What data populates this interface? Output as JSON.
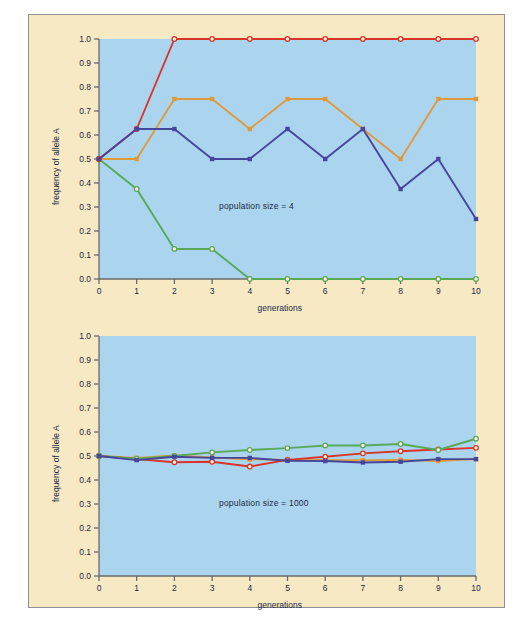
{
  "figure": {
    "background": "#f7e9c4",
    "plot_background": "#abd4ef",
    "border_color": "#8d8f93"
  },
  "chart_data": [
    {
      "type": "line",
      "title": "",
      "annotation": "population size = 4",
      "xlabel": "generations",
      "ylabel": "frequency of allele A",
      "x": [
        0,
        1,
        2,
        3,
        4,
        5,
        6,
        7,
        8,
        9,
        10
      ],
      "xticklabels": [
        "0",
        "1",
        "2",
        "3",
        "4",
        "5",
        "6",
        "7",
        "8",
        "9",
        "10"
      ],
      "yticklabels": [
        "0.0",
        "0.1",
        "0.2",
        "0.3",
        "0.4",
        "0.5",
        "0.6",
        "0.7",
        "0.8",
        "0.9",
        "1.0"
      ],
      "xlim": [
        0,
        10
      ],
      "ylim": [
        0,
        1
      ],
      "grid": false,
      "legend": "none",
      "series": [
        {
          "name": "population 1",
          "color": "#d9352b",
          "marker": "open-circle",
          "values": [
            0.5,
            0.625,
            1.0,
            1.0,
            1.0,
            1.0,
            1.0,
            1.0,
            1.0,
            1.0,
            1.0
          ]
        },
        {
          "name": "population 2",
          "color": "#e09a3e",
          "marker": "filled-square",
          "values": [
            0.5,
            0.5,
            0.75,
            0.75,
            0.625,
            0.75,
            0.75,
            0.625,
            0.5,
            0.75,
            0.75
          ]
        },
        {
          "name": "population 3",
          "color": "#46479b",
          "marker": "filled-square",
          "values": [
            0.5,
            0.625,
            0.625,
            0.5,
            0.5,
            0.625,
            0.5,
            0.625,
            0.375,
            0.5,
            0.25
          ]
        },
        {
          "name": "population 4",
          "color": "#5aa85a",
          "marker": "open-circle",
          "values": [
            0.5,
            0.375,
            0.125,
            0.125,
            0.0,
            0.0,
            0.0,
            0.0,
            0.0,
            0.0,
            0.0
          ]
        }
      ]
    },
    {
      "type": "line",
      "title": "",
      "annotation": "population size = 1000",
      "xlabel": "generations",
      "ylabel": "frequency of allele A",
      "x": [
        0,
        1,
        2,
        3,
        4,
        5,
        6,
        7,
        8,
        9,
        10
      ],
      "xticklabels": [
        "0",
        "1",
        "2",
        "3",
        "4",
        "5",
        "6",
        "7",
        "8",
        "9",
        "10"
      ],
      "yticklabels": [
        "0.0",
        "0.1",
        "0.2",
        "0.3",
        "0.4",
        "0.5",
        "0.6",
        "0.7",
        "0.8",
        "0.9",
        "1.0"
      ],
      "xlim": [
        0,
        10
      ],
      "ylim": [
        0,
        1
      ],
      "grid": false,
      "legend": "none",
      "series": [
        {
          "name": "population 1",
          "color": "#d9352b",
          "marker": "open-circle",
          "values": [
            0.5,
            0.487,
            0.474,
            0.476,
            0.456,
            0.484,
            0.497,
            0.511,
            0.52,
            0.527,
            0.534
          ]
        },
        {
          "name": "population 2",
          "color": "#e09a3e",
          "marker": "filled-square",
          "values": [
            0.5,
            0.492,
            0.502,
            0.494,
            0.486,
            0.484,
            0.482,
            0.482,
            0.484,
            0.479,
            0.487
          ]
        },
        {
          "name": "population 3",
          "color": "#46479b",
          "marker": "filled-square",
          "values": [
            0.5,
            0.483,
            0.497,
            0.492,
            0.492,
            0.48,
            0.479,
            0.473,
            0.476,
            0.487,
            0.487
          ]
        },
        {
          "name": "population 4",
          "color": "#5aa85a",
          "marker": "open-circle",
          "values": [
            0.5,
            0.489,
            0.5,
            0.515,
            0.525,
            0.533,
            0.544,
            0.544,
            0.55,
            0.525,
            0.572
          ]
        }
      ]
    }
  ]
}
